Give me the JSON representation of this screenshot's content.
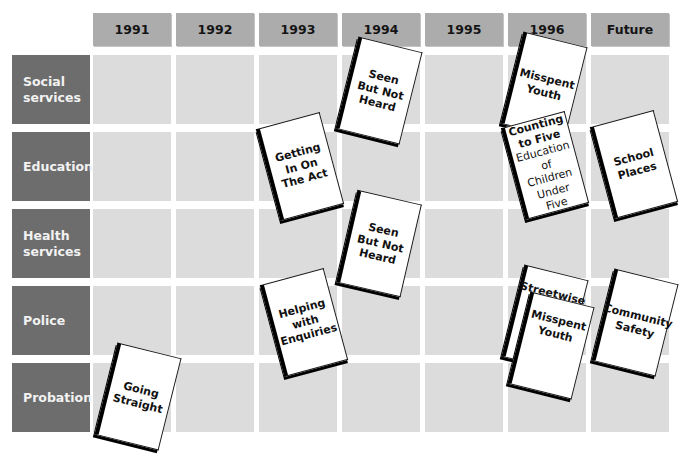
{
  "diagram": {
    "columns": [
      "1991",
      "1992",
      "1993",
      "1994",
      "1995",
      "1996",
      "Future"
    ],
    "rows": [
      {
        "label_line1": "Social",
        "label_line2": "services"
      },
      {
        "label_line1": "Education",
        "label_line2": ""
      },
      {
        "label_line1": "Health",
        "label_line2": "services"
      },
      {
        "label_line1": "Police",
        "label_line2": ""
      },
      {
        "label_line1": "Probation",
        "label_line2": ""
      }
    ],
    "documents": [
      {
        "row": "Social services",
        "column": "1994",
        "title": "Seen But Not Heard",
        "subtitle": ""
      },
      {
        "row": "Social services",
        "column": "1996",
        "title": "Misspent Youth",
        "subtitle": ""
      },
      {
        "row": "Education",
        "column": "1993",
        "title": "Getting In On The Act",
        "subtitle": ""
      },
      {
        "row": "Education",
        "column": "1996",
        "title": "Counting to Five",
        "subtitle": "Education of Children Under Five"
      },
      {
        "row": "Education",
        "column": "Future",
        "title": "School Places",
        "subtitle": ""
      },
      {
        "row": "Health services",
        "column": "1994",
        "title": "Seen But Not Heard",
        "subtitle": ""
      },
      {
        "row": "Police",
        "column": "1993",
        "title": "Helping with Enquiries",
        "subtitle": ""
      },
      {
        "row": "Police",
        "column": "1996",
        "title": "Streetwise",
        "subtitle": ""
      },
      {
        "row": "Police",
        "column": "1996",
        "title": "Misspent Youth",
        "subtitle": ""
      },
      {
        "row": "Police",
        "column": "Future",
        "title": "Community Safety",
        "subtitle": ""
      },
      {
        "row": "Probation",
        "column": "1991",
        "title": "Going Straight",
        "subtitle": ""
      }
    ],
    "colors": {
      "header_bg": "#acacac",
      "row_label_bg": "#6d6d6d",
      "cell_bg": "#dcdcdc",
      "document_bg": "#ffffff",
      "document_spine": "#000000"
    }
  }
}
